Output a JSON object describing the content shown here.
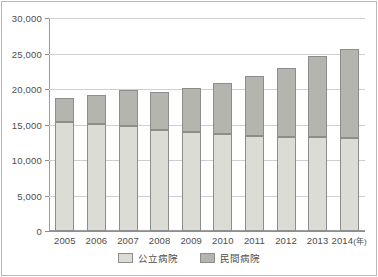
{
  "chart_data": {
    "type": "bar",
    "subtype": "stacked-bar",
    "title": "",
    "xlabel": "年",
    "ylabel": "",
    "categories": [
      "2005",
      "2006",
      "2007",
      "2008",
      "2009",
      "2010",
      "2011",
      "2012",
      "2013",
      "2014"
    ],
    "xtick_labels": [
      "2005",
      "2006",
      "2007",
      "2008",
      "2009",
      "2010",
      "2011",
      "2012",
      "2013",
      "2014(年)"
    ],
    "ylim": [
      0,
      30000
    ],
    "ytick_values": [
      0,
      5000,
      10000,
      15000,
      20000,
      25000,
      30000
    ],
    "ytick_labels": [
      "0",
      "5,000",
      "10,000",
      "15,000",
      "20,000",
      "25,000",
      "30,000"
    ],
    "grid": true,
    "grid_axis": "y",
    "legend_position": "bottom-center",
    "series": [
      {
        "name": "公立病院",
        "color": "#dcdcd7",
        "values": [
          15400,
          15100,
          14800,
          14200,
          14000,
          13700,
          13400,
          13300,
          13300,
          13100
        ]
      },
      {
        "name": "民間病院",
        "color": "#b5b5b0",
        "values": [
          3300,
          4100,
          5100,
          5400,
          6200,
          7100,
          8400,
          9700,
          11300,
          12600
        ]
      }
    ],
    "totals": [
      18700,
      19200,
      19900,
      19600,
      20200,
      20800,
      21800,
      23000,
      24600,
      25700
    ]
  },
  "legend": {
    "items": [
      {
        "label": "公立病院",
        "color": "#dcdcd7"
      },
      {
        "label": "民間病院",
        "color": "#b5b5b0"
      }
    ]
  }
}
